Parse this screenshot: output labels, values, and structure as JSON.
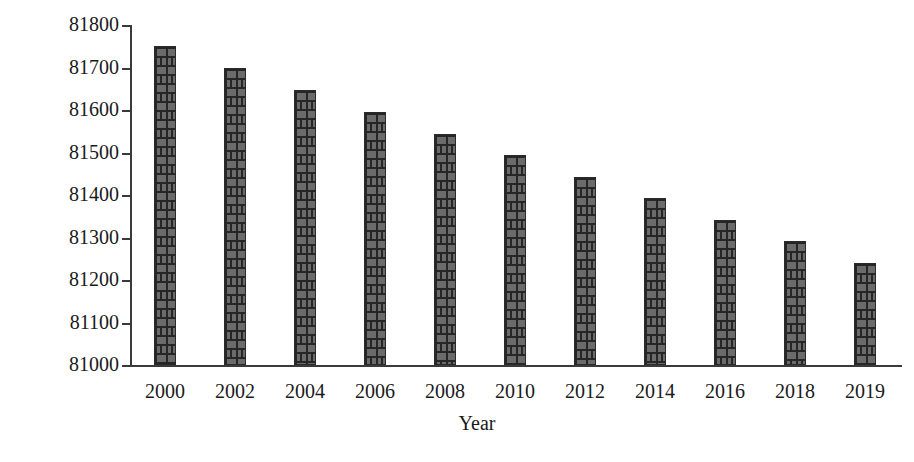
{
  "chart_data": {
    "type": "bar",
    "title": "",
    "xlabel": "Year",
    "ylabel": "Forest Cover (Hectares)",
    "categories": [
      "2000",
      "2002",
      "2004",
      "2006",
      "2008",
      "2010",
      "2012",
      "2014",
      "2016",
      "2018",
      "2019"
    ],
    "values": [
      81750,
      81698,
      81646,
      81595,
      81544,
      81494,
      81443,
      81392,
      81342,
      81291,
      81240
    ],
    "ylim": [
      81000,
      81800
    ],
    "ytick_labels": [
      "81800",
      "81700",
      "81600",
      "81500",
      "81400",
      "81300",
      "81200",
      "81100",
      "81000"
    ],
    "ytick_values": [
      81800,
      81700,
      81600,
      81500,
      81400,
      81300,
      81200,
      81100,
      81000
    ],
    "grid": false,
    "legend": false,
    "legend_position": "none",
    "bar_fill": "#6b6b6b",
    "bar_edge": "#262626",
    "axis_color": "#3a3a3a",
    "background": "#ffffff",
    "bar_pattern": "brick"
  }
}
